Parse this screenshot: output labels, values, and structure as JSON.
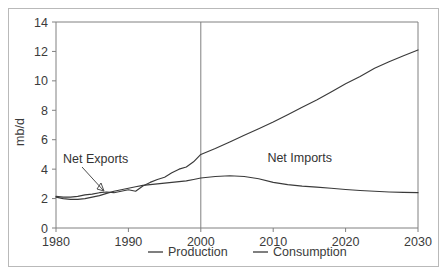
{
  "chart_data": {
    "type": "line",
    "title": "",
    "subtitle": "",
    "xlabel": "",
    "ylabel": "mb/d",
    "xlim": [
      1980,
      2030
    ],
    "ylim": [
      0,
      14
    ],
    "grid": false,
    "legend_position": "bottom",
    "x_ticks": [
      "1980",
      "1990",
      "2000",
      "2010",
      "2020",
      "2030"
    ],
    "x_tick_values": [
      1980,
      1990,
      2000,
      2010,
      2020,
      2030
    ],
    "y_ticks": [
      "0",
      "2",
      "4",
      "6",
      "8",
      "10",
      "12",
      "14"
    ],
    "y_tick_values": [
      0,
      2,
      4,
      6,
      8,
      10,
      12,
      14
    ],
    "divider_x": 2000,
    "series": [
      {
        "name": "Production",
        "x": [
          1980,
          1981,
          1982,
          1983,
          1984,
          1985,
          1986,
          1987,
          1988,
          1989,
          1990,
          1991,
          1992,
          1993,
          1994,
          1995,
          1996,
          1997,
          1998,
          1999,
          2000,
          2002,
          2004,
          2006,
          2008,
          2010,
          2012,
          2014,
          2016,
          2018,
          2020,
          2022,
          2024,
          2026,
          2028,
          2030
        ],
        "values": [
          2.1,
          2.0,
          1.95,
          1.95,
          2.0,
          2.1,
          2.2,
          2.35,
          2.5,
          2.6,
          2.7,
          2.8,
          2.9,
          2.95,
          3.0,
          3.05,
          3.1,
          3.15,
          3.2,
          3.3,
          3.4,
          3.5,
          3.55,
          3.5,
          3.35,
          3.1,
          2.95,
          2.85,
          2.78,
          2.7,
          2.62,
          2.55,
          2.5,
          2.45,
          2.42,
          2.4
        ]
      },
      {
        "name": "Consumption",
        "x": [
          1980,
          1981,
          1982,
          1983,
          1984,
          1985,
          1986,
          1987,
          1988,
          1989,
          1990,
          1991,
          1992,
          1993,
          1994,
          1995,
          1996,
          1997,
          1998,
          1999,
          2000,
          2002,
          2004,
          2006,
          2008,
          2010,
          2012,
          2014,
          2016,
          2018,
          2020,
          2022,
          2024,
          2026,
          2028,
          2030
        ],
        "values": [
          2.15,
          2.1,
          2.1,
          2.15,
          2.25,
          2.3,
          2.4,
          2.45,
          2.4,
          2.5,
          2.6,
          2.5,
          2.85,
          3.1,
          3.3,
          3.45,
          3.75,
          4.0,
          4.15,
          4.5,
          5.0,
          5.4,
          5.85,
          6.3,
          6.75,
          7.2,
          7.7,
          8.2,
          8.7,
          9.25,
          9.8,
          10.3,
          10.85,
          11.3,
          11.7,
          12.1
        ]
      }
    ],
    "annotations": [
      {
        "label": "Net Exports",
        "x": 1985,
        "y": 4.2
      },
      {
        "label": "Net Imports",
        "x": 2015,
        "y": 4.5
      }
    ],
    "legend": [
      {
        "label": "Production"
      },
      {
        "label": "Consumption"
      }
    ],
    "colors": {
      "line": "#3a3a3a",
      "axis": "#808080",
      "text": "#3b3b3b",
      "frame": "#b9b9b9",
      "background": "#ffffff"
    }
  }
}
